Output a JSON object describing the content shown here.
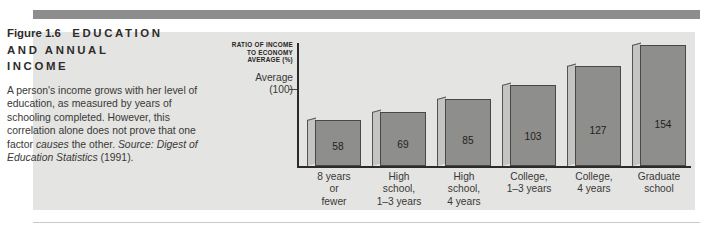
{
  "figure": {
    "number_label": "Figure 1.6",
    "title_caps": "EDUCATION AND ANNUAL INCOME",
    "title_line1_caps": "EDUCATION",
    "title_line2_caps": "AND ANNUAL",
    "title_line3_caps": "INCOME",
    "body_part1": "A person's income grows with her level of education, as measured by years of schooling completed. However, this correlation alone does not prove that one factor ",
    "body_italic1": "causes",
    "body_part2": " the other. ",
    "body_italic2": "Source:",
    "body_part3": " ",
    "body_italic3": "Digest of Education Statistics",
    "body_part4": " (1991)."
  },
  "colors": {
    "panel_background": "#e4e4e2",
    "top_rule": "#8d8d8d",
    "bar_front": "#8e8e8c",
    "bar_side": "#c4c4c2",
    "axis": "#2c2b29",
    "text": "#3a3836"
  },
  "chart_data": {
    "type": "bar",
    "ylabel": "RATIO OF INCOME TO ECONOMY AVERAGE (%)",
    "ylabel_line1": "RATIO OF INCOME",
    "ylabel_line2": "TO ECONOMY",
    "ylabel_line3": "AVERAGE (%)",
    "xlabel": "",
    "reference_line_label_line1": "Average",
    "reference_line_label_line2": "(100)",
    "reference_value": 100,
    "ylim": [
      0,
      170
    ],
    "grid": false,
    "legend": "none",
    "categories": [
      "8 years or fewer",
      "High school, 1–3 years",
      "High school, 4 years",
      "College, 1–3 years",
      "College, 4 years",
      "Graduate school"
    ],
    "category_lines": [
      [
        "8 years",
        "or",
        "fewer"
      ],
      [
        "High",
        "school,",
        "1–3 years"
      ],
      [
        "High",
        "school,",
        "4 years"
      ],
      [
        "College,",
        "1–3 years"
      ],
      [
        "College,",
        "4 years"
      ],
      [
        "Graduate",
        "school"
      ]
    ],
    "values": [
      58,
      69,
      85,
      103,
      127,
      154
    ],
    "value_labels": [
      "58",
      "69",
      "85",
      "103",
      "127",
      "154"
    ]
  }
}
